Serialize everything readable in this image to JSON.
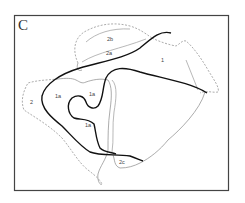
{
  "figure": {
    "panel_label": "C",
    "regions": [
      {
        "id": "2b",
        "label": "2b",
        "x": 111,
        "y": 41
      },
      {
        "id": "2a",
        "label": "2a",
        "x": 110,
        "y": 55
      },
      {
        "id": "1",
        "label": "1",
        "x": 162,
        "y": 61
      },
      {
        "id": "2",
        "label": "2",
        "x": 31,
        "y": 103
      },
      {
        "id": "1a-left",
        "label": "1a",
        "x": 57,
        "y": 97
      },
      {
        "id": "1a-top",
        "label": "1a",
        "x": 91,
        "y": 95
      },
      {
        "id": "1a-bottom",
        "label": "1a",
        "x": 88,
        "y": 126
      },
      {
        "id": "2c",
        "label": "2c",
        "x": 122,
        "y": 163
      }
    ],
    "colors": {
      "frame": "#444444",
      "thick_line": "#111111",
      "thin_line": "#777777",
      "dashed_line": "#888888",
      "background": "#ffffff"
    }
  }
}
